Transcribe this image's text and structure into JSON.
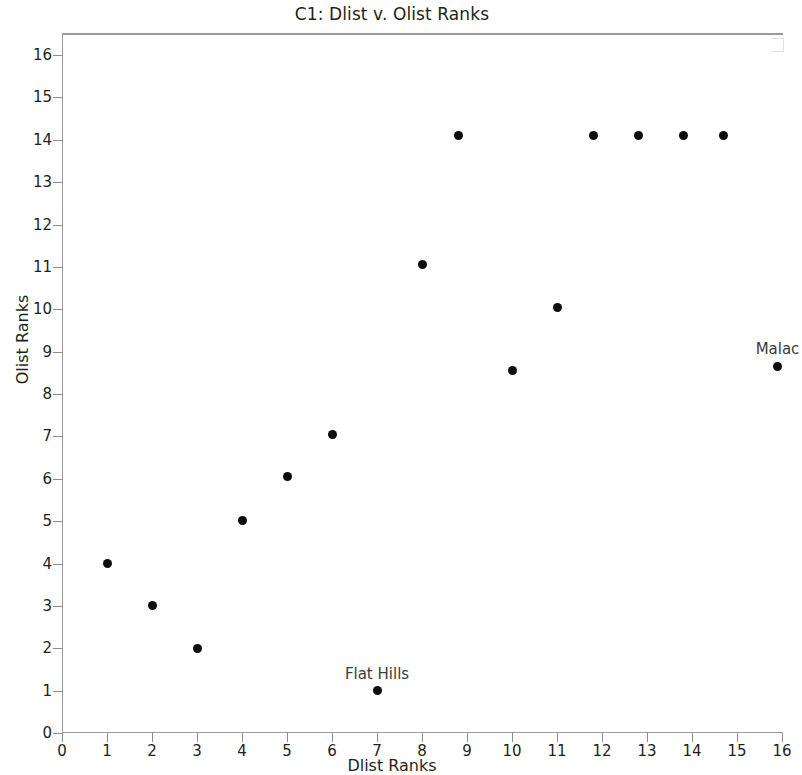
{
  "chart_data": {
    "type": "scatter",
    "title": "C1: Dlist v. Olist Ranks",
    "xlabel": "Dlist Ranks",
    "ylabel": "Olist Ranks",
    "xlim": [
      0,
      16
    ],
    "ylim": [
      0,
      16
    ],
    "xticks": [
      0,
      1,
      2,
      3,
      4,
      5,
      6,
      7,
      8,
      9,
      10,
      11,
      12,
      13,
      14,
      15,
      16
    ],
    "yticks": [
      0,
      1,
      2,
      3,
      4,
      5,
      6,
      7,
      8,
      9,
      10,
      11,
      12,
      13,
      14,
      15,
      16
    ],
    "xtick_labels": [
      "0",
      "1",
      "2",
      "3",
      "4",
      "5",
      "6",
      "7",
      "8",
      "9",
      "10",
      "11",
      "12",
      "13",
      "14",
      "15",
      "16"
    ],
    "ytick_labels": [
      "0",
      "1",
      "2",
      "3",
      "4",
      "5",
      "6",
      "7",
      "8",
      "9",
      "10",
      "11",
      "12",
      "13",
      "14",
      "15",
      "16"
    ],
    "grid": false,
    "legend": null,
    "marker_color": "#0d0d0d",
    "x": [
      1,
      2,
      3,
      4,
      5,
      6,
      7,
      8,
      8.8,
      10,
      11,
      11.8,
      12.8,
      13.8,
      14.7,
      15.9
    ],
    "y": [
      4.0,
      3.0,
      2.0,
      5.02,
      6.05,
      7.05,
      1.0,
      11.05,
      14.1,
      8.55,
      10.05,
      14.1,
      14.1,
      14.1,
      14.1,
      8.65
    ],
    "points": [
      {
        "x": 1,
        "y": 4.0
      },
      {
        "x": 2,
        "y": 3.0
      },
      {
        "x": 3,
        "y": 2.0
      },
      {
        "x": 4,
        "y": 5.02
      },
      {
        "x": 5,
        "y": 6.05
      },
      {
        "x": 6,
        "y": 7.05
      },
      {
        "x": 7,
        "y": 1.0,
        "label": "Flat Hills"
      },
      {
        "x": 8,
        "y": 11.05
      },
      {
        "x": 8.8,
        "y": 14.1
      },
      {
        "x": 10,
        "y": 8.55
      },
      {
        "x": 11,
        "y": 10.05
      },
      {
        "x": 11.8,
        "y": 14.1
      },
      {
        "x": 12.8,
        "y": 14.1
      },
      {
        "x": 13.8,
        "y": 14.1
      },
      {
        "x": 14.7,
        "y": 14.1
      },
      {
        "x": 15.9,
        "y": 8.65,
        "label": "Malac"
      }
    ],
    "annotations": [
      {
        "text": "Flat Hills",
        "x": 7,
        "y": 1.0
      },
      {
        "text": "Malac",
        "x": 15.9,
        "y": 8.65
      }
    ]
  }
}
